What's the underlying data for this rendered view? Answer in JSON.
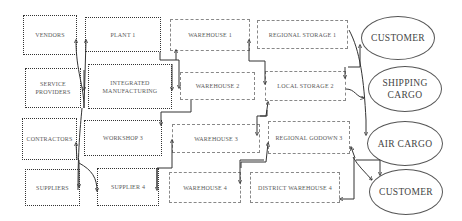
{
  "diagram": {
    "title": "",
    "columns": [
      {
        "name": "sources",
        "style": "dotted",
        "nodes": [
          {
            "id": "vendors",
            "label": "VENDORS"
          },
          {
            "id": "service_providers",
            "label": "SERVICE\nPROVIDERS"
          },
          {
            "id": "contractors",
            "label": "CONTRACTORS"
          },
          {
            "id": "suppliers",
            "label": "SUPPLIERS"
          }
        ]
      },
      {
        "name": "production",
        "style": "dotted",
        "nodes": [
          {
            "id": "plant_1",
            "label": "PLANT 1"
          },
          {
            "id": "integrated_manufacturing",
            "label": "INTEGRATED\nMANUFACTURING"
          },
          {
            "id": "workshop_3",
            "label": "WORKSHOP 3"
          },
          {
            "id": "supplier_4",
            "label": "SUPPLIER 4"
          }
        ]
      },
      {
        "name": "warehouses",
        "style": "dashed",
        "nodes": [
          {
            "id": "warehouse_1",
            "label": "WAREHOUSE 1"
          },
          {
            "id": "warehouse_2",
            "label": "WAREHOUSE 2"
          },
          {
            "id": "warehouse_3",
            "label": "WAREHOUSE 3"
          },
          {
            "id": "warehouse_4",
            "label": "WAREHOUSE 4"
          }
        ]
      },
      {
        "name": "distribution",
        "style": "dashed",
        "nodes": [
          {
            "id": "regional_storage_1",
            "label": "REGIONAL STORAGE 1"
          },
          {
            "id": "local_storage_2",
            "label": "LOCAL STORAGE 2"
          },
          {
            "id": "regional_godown_3",
            "label": "REGIONAL GODOWN 3"
          },
          {
            "id": "district_warehouse_4",
            "label": "DISTRICT WAREHOUSE 4"
          }
        ]
      },
      {
        "name": "outlets",
        "style": "ellipse",
        "nodes": [
          {
            "id": "customer_1",
            "label": "CUSTOMER"
          },
          {
            "id": "shipping_cargo",
            "label": "SHIPPING\nCARGO"
          },
          {
            "id": "air_cargo",
            "label": "AIR CARGO"
          },
          {
            "id": "customer_2",
            "label": "CUSTOMER"
          }
        ]
      }
    ],
    "edges": [
      {
        "from": "service_providers",
        "to": "vendors"
      },
      {
        "from": "service_providers",
        "to": "plant_1"
      },
      {
        "from": "plant_1",
        "to": "integrated_manufacturing"
      },
      {
        "from": "contractors",
        "to": "suppliers"
      },
      {
        "from": "suppliers",
        "to": "contractors"
      },
      {
        "from": "contractors",
        "to": "supplier_4"
      },
      {
        "from": "plant_1",
        "to": "warehouse_1"
      },
      {
        "from": "warehouse_1",
        "to": "warehouse_2"
      },
      {
        "from": "integrated_manufacturing",
        "to": "workshop_3"
      },
      {
        "from": "supplier_4",
        "to": "warehouse_3"
      },
      {
        "from": "warehouse_2",
        "to": "warehouse_3"
      },
      {
        "from": "warehouse_1",
        "to": "local_storage_2"
      },
      {
        "from": "local_storage_2",
        "to": "regional_storage_1"
      },
      {
        "from": "warehouse_3",
        "to": "local_storage_2"
      },
      {
        "from": "regional_godown_3",
        "to": "warehouse_3"
      },
      {
        "from": "warehouse_4",
        "to": "regional_godown_3"
      },
      {
        "from": "regional_storage_1",
        "to": "customer_1"
      },
      {
        "from": "local_storage_2",
        "to": "shipping_cargo"
      },
      {
        "from": "regional_storage_1",
        "to": "air_cargo"
      },
      {
        "from": "regional_godown_3",
        "to": "customer_2"
      },
      {
        "from": "customer_2",
        "to": "regional_godown_3"
      },
      {
        "from": "regional_godown_3",
        "to": "district_warehouse_4"
      }
    ]
  }
}
